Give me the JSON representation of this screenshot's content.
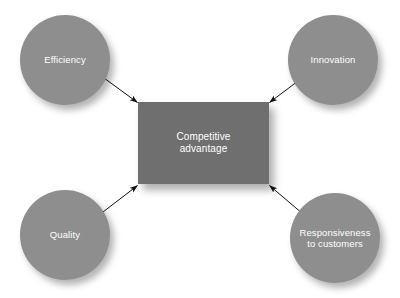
{
  "diagram": {
    "type": "hub-and-spoke",
    "background_color": "#ffffff",
    "circle_color": "#8e8e8e",
    "box_color": "#6f6f6f",
    "text_color": "#ffffff",
    "arrow_color": "#1a1a1a",
    "center": {
      "id": "competitive-advantage",
      "label": "Competitive\nadvantage",
      "shape": "rectangle"
    },
    "nodes": [
      {
        "id": "efficiency",
        "label": "Efficiency",
        "shape": "circle",
        "position": "top-left"
      },
      {
        "id": "innovation",
        "label": "Innovation",
        "shape": "circle",
        "position": "top-right"
      },
      {
        "id": "quality",
        "label": "Quality",
        "shape": "circle",
        "position": "bottom-left"
      },
      {
        "id": "responsiveness",
        "label": "Responsiveness\nto customers",
        "shape": "circle",
        "position": "bottom-right"
      }
    ],
    "arrows": [
      {
        "id": "arrow-efficiency-to-center",
        "from": "efficiency",
        "to": "competitive-advantage"
      },
      {
        "id": "arrow-innovation-to-center",
        "from": "innovation",
        "to": "competitive-advantage"
      },
      {
        "id": "arrow-quality-to-center",
        "from": "quality",
        "to": "competitive-advantage"
      },
      {
        "id": "arrow-responsiveness-to-center",
        "from": "responsiveness",
        "to": "competitive-advantage"
      }
    ]
  }
}
